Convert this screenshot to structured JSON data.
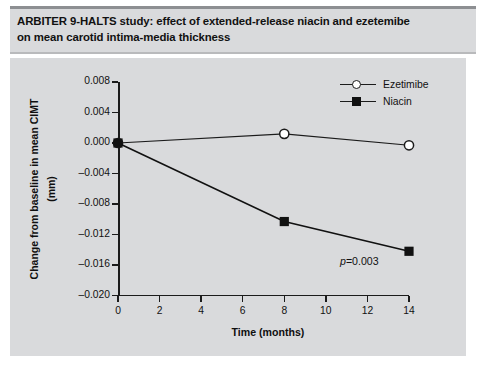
{
  "figure": {
    "title": "ARBITER 9-HALTS study: effect of extended-release niacin and ezetemibe on mean carotid intima-media thickness",
    "title_line_1": "ARBITER 9-HALTS study: effect of extended-release niacin and ezetemibe",
    "title_line_2": "on mean carotid intima-media thickness",
    "panel_background": "#d9dadc",
    "title_background": "#d9dadc",
    "ink_color": "#1b1b1b"
  },
  "annotations": {
    "pvalue_prefix": "p",
    "pvalue_text": "=0.003",
    "pvalue_full": "p=0.003"
  },
  "chart_data": {
    "type": "line",
    "title": "ARBITER 9-HALTS study: effect of extended-release niacin and ezetemibe on mean carotid intima-media thickness",
    "subtitle": "",
    "xlabel": "Time (months)",
    "ylabel": "Change from baseline in mean CIMT (mm)",
    "ylabel_line_1": "Change from baseline in mean CIMT",
    "ylabel_line_2": "(mm)",
    "xlim": [
      0,
      14
    ],
    "ylim": [
      -0.02,
      0.008
    ],
    "xticks": [
      0,
      2,
      4,
      6,
      8,
      10,
      12,
      14
    ],
    "xtick_labels": [
      "0",
      "2",
      "4",
      "6",
      "8",
      "10",
      "12",
      "14"
    ],
    "yticks": [
      0.008,
      0.004,
      0.0,
      -0.004,
      -0.008,
      -0.012,
      -0.016,
      -0.02
    ],
    "ytick_labels": [
      "0.008",
      "0.004",
      "0.000",
      "-0.004",
      "-0.008",
      "-0.012",
      "-0.016",
      "-0.020"
    ],
    "grid": false,
    "legend_position": "top-right",
    "annotation": "p=0.003",
    "series": [
      {
        "name": "Ezetimibe",
        "marker": "open-circle",
        "color": "#1b1b1b",
        "marker_fill": "#ffffff",
        "x": [
          0,
          8,
          14
        ],
        "values": [
          0.0,
          0.0012,
          -0.0003
        ]
      },
      {
        "name": "Niacin",
        "marker": "filled-square",
        "color": "#111111",
        "marker_fill": "#111111",
        "x": [
          0,
          8,
          14
        ],
        "values": [
          0.0,
          -0.0103,
          -0.0142
        ]
      }
    ]
  },
  "legend": {
    "items": [
      {
        "label": "Ezetimibe",
        "marker": "open-circle"
      },
      {
        "label": "Niacin",
        "marker": "filled-square"
      }
    ]
  }
}
